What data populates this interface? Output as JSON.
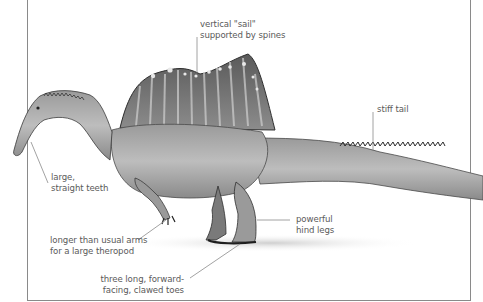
{
  "figure": {
    "colors": {
      "background": "#ffffff",
      "leader_line": "#8a8a8a",
      "label_text": "#5a5a5a",
      "body_light": "#c9c9c9",
      "body_mid": "#8f8f8f",
      "body_dark": "#3a3a3a"
    }
  },
  "labels": {
    "sail": {
      "line1": "vertical \"sail\"",
      "line2": "supported by spines"
    },
    "tail": {
      "line1": "stiff tail"
    },
    "teeth": {
      "line1": "large,",
      "line2": "straight teeth"
    },
    "arms": {
      "line1": "longer than usual arms",
      "line2": "for a large theropod"
    },
    "legs": {
      "line1": "powerful",
      "line2": "hind legs"
    },
    "toes": {
      "line1": "three long, forward-",
      "line2": "facing, clawed toes"
    }
  }
}
